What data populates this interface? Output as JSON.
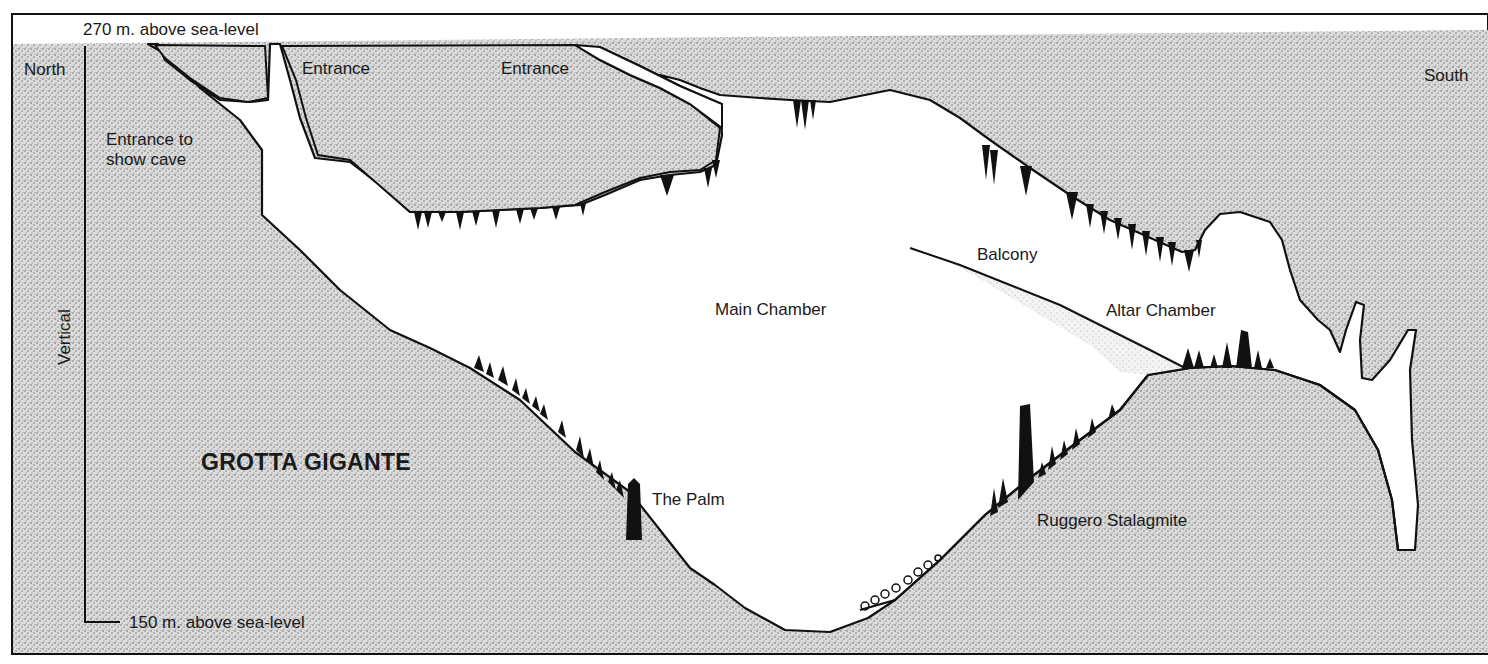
{
  "diagram": {
    "title": "GROTTA GIGANTE",
    "type": "cave cross-section",
    "colors": {
      "rock_stipple": "#bdbdbd",
      "rock_base": "#d6d6d6",
      "cave_void": "#ffffff",
      "outline": "#111111",
      "formations": "#111111"
    },
    "scale": {
      "top_label": "270 m. above sea-level",
      "bottom_label": "150 m. above sea-level",
      "axis_label": "Vertical"
    },
    "orientation": {
      "left": "North",
      "right": "South"
    },
    "labels": {
      "entrance_show_cave": "Entrance to show cave",
      "entrance_1": "Entrance",
      "entrance_2": "Entrance",
      "main_chamber": "Main Chamber",
      "balcony": "Balcony",
      "altar_chamber": "Altar Chamber",
      "the_palm": "The Palm",
      "ruggero_stalagmite": "Ruggero Stalagmite"
    }
  }
}
